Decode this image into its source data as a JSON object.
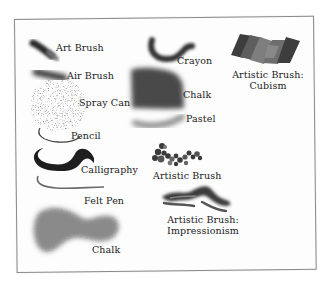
{
  "figure": {
    "title": "",
    "swatches": [
      {
        "id": "art-brush",
        "label": "Art Brush"
      },
      {
        "id": "air-brush",
        "label": "Air Brush"
      },
      {
        "id": "spray-can",
        "label": "Spray Can"
      },
      {
        "id": "pencil",
        "label": "Pencil"
      },
      {
        "id": "calligraphy",
        "label": "Calligraphy"
      },
      {
        "id": "felt-pen",
        "label": "Felt Pen"
      },
      {
        "id": "chalk-large",
        "label": "Chalk"
      },
      {
        "id": "crayon",
        "label": "Crayon"
      },
      {
        "id": "chalk",
        "label": "Chalk"
      },
      {
        "id": "pastel",
        "label": "Pastel"
      },
      {
        "id": "artistic-brush",
        "label": "Artistic Brush"
      },
      {
        "id": "artistic-brush-impressionism",
        "label_line1": "Artistic Brush:",
        "label_line2": "Impressionism"
      },
      {
        "id": "artistic-brush-cubism",
        "label_line1": "Artistic Brush:",
        "label_line2": "Cubism"
      }
    ]
  },
  "colors": {
    "ink_dark": "#2a2a2a",
    "ink_mid": "#555555",
    "ink_light": "#9a9a9a",
    "frame_border": "#8a8a8a",
    "cubism_dark": "#3d3d3d",
    "cubism_mid": "#6e6e6e",
    "cubism_light": "#8c8c8c"
  }
}
